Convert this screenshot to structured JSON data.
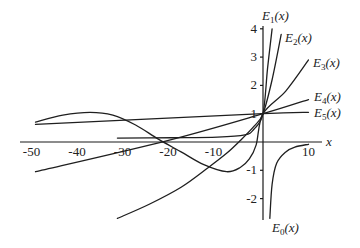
{
  "chart_data": {
    "type": "line",
    "title": "",
    "xlabel": "x",
    "ylabel": "",
    "xlim": [
      -52,
      12
    ],
    "ylim": [
      -2.8,
      4.2
    ],
    "grid": false,
    "x_ticks": [
      -50,
      -40,
      -30,
      -20,
      -10,
      10
    ],
    "x_tick_labels": [
      "-50",
      "-40",
      "-30",
      "-20",
      "-10",
      "10"
    ],
    "y_ticks": [
      4,
      3,
      2,
      1,
      -1,
      -2
    ],
    "y_tick_labels": [
      "4",
      "3",
      "2",
      "1",
      "-1",
      "-2"
    ],
    "series": [
      {
        "name": "E_0(x)",
        "label_main": "E",
        "label_sub": "0",
        "label_tail": "(x)",
        "points": [
          [
            1.5,
            -2.7
          ],
          [
            2.0,
            -1.5
          ],
          [
            3,
            -0.75
          ],
          [
            5,
            -0.35
          ],
          [
            7,
            -0.18
          ],
          [
            10,
            -0.08
          ]
        ]
      },
      {
        "name": "E_1(x)",
        "label_main": "E",
        "label_sub": "1",
        "label_tail": "(x)",
        "points": [
          [
            -32,
            0.14
          ],
          [
            -20,
            0.15
          ],
          [
            -10,
            0.17
          ],
          [
            -4,
            0.25
          ],
          [
            -2,
            0.45
          ],
          [
            0,
            1
          ],
          [
            1,
            2.6
          ],
          [
            2,
            4.0
          ]
        ]
      },
      {
        "name": "E_2(x)",
        "label_main": "E",
        "label_sub": "2",
        "label_tail": "(x)",
        "points": [
          [
            -32,
            -2.7
          ],
          [
            -25,
            -2.2
          ],
          [
            -18,
            -1.6
          ],
          [
            -12,
            -0.9
          ],
          [
            -8,
            -0.4
          ],
          [
            -5,
            0.05
          ],
          [
            -2,
            0.55
          ],
          [
            0,
            1
          ],
          [
            2,
            2.2
          ],
          [
            4,
            3.8
          ]
        ]
      },
      {
        "name": "E_3(x)",
        "label_main": "E",
        "label_sub": "3",
        "label_tail": "(x)",
        "points": [
          [
            -50,
            0.7
          ],
          [
            -44,
            0.95
          ],
          [
            -38,
            1.05
          ],
          [
            -33,
            0.95
          ],
          [
            -28,
            0.6
          ],
          [
            -23,
            0.1
          ],
          [
            -18,
            -0.35
          ],
          [
            -13,
            -0.8
          ],
          [
            -8,
            -1.05
          ],
          [
            -5,
            -0.9
          ],
          [
            -3,
            -0.6
          ],
          [
            -1.5,
            -0.1
          ],
          [
            0,
            1
          ],
          [
            5,
            1.8
          ],
          [
            10,
            2.9
          ]
        ]
      },
      {
        "name": "E_4(x)",
        "label_main": "E",
        "label_sub": "4",
        "label_tail": "(x)",
        "points": [
          [
            -50,
            -1.05
          ],
          [
            -21,
            0.05
          ],
          [
            0,
            1
          ],
          [
            10,
            1.5
          ]
        ]
      },
      {
        "name": "E_5(x)",
        "label_main": "E",
        "label_sub": "5",
        "label_tail": "(x)",
        "points": [
          [
            -50,
            0.62
          ],
          [
            0,
            1
          ],
          [
            10,
            1.05
          ]
        ]
      }
    ],
    "annotations": [
      {
        "text": "E_1(x)",
        "x": 2.5,
        "y": 4.3
      },
      {
        "text": "E_2(x)",
        "x": 5,
        "y": 3.7
      },
      {
        "text": "E_3(x)",
        "x": 11,
        "y": 2.9
      },
      {
        "text": "E_4(x)",
        "x": 11,
        "y": 1.5
      },
      {
        "text": "E_5(x)",
        "x": 11,
        "y": 1.05
      },
      {
        "text": "E_0(x)",
        "x": 2.5,
        "y": -3.0
      }
    ]
  },
  "axes": {
    "x_name": "x"
  }
}
